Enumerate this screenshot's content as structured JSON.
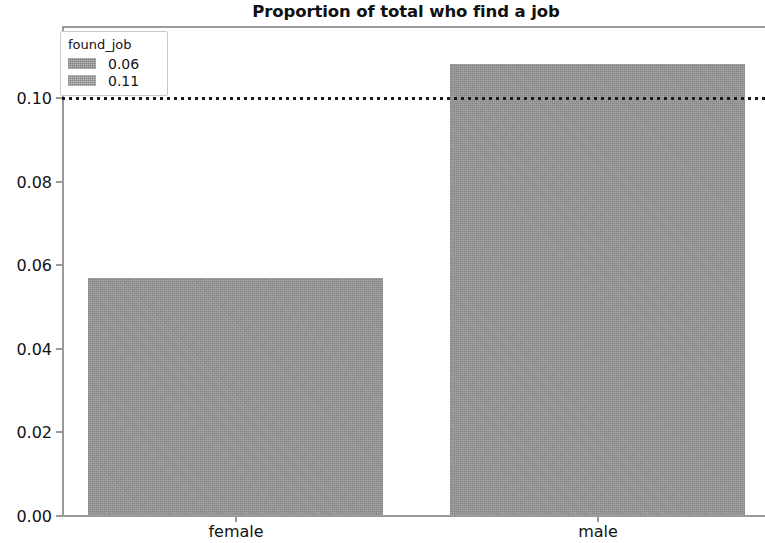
{
  "chart_data": {
    "type": "bar",
    "title": "Proportion of total who find a job",
    "xlabel": "",
    "ylabel": "",
    "categories": [
      "female",
      "male"
    ],
    "values": [
      0.057,
      0.108
    ],
    "ylim": [
      0.0,
      0.1172
    ],
    "yticks": [
      "0.00",
      "0.02",
      "0.04",
      "0.06",
      "0.08",
      "0.10"
    ],
    "ytick_values": [
      0.0,
      0.02,
      0.04,
      0.06,
      0.08,
      0.1
    ],
    "grid": false,
    "annotations": [
      {
        "type": "horizontal-reference-line",
        "value": 0.1,
        "style": "dotted",
        "color": "#1a1a1a"
      }
    ],
    "bar_color": "#9a9a9a",
    "legend": {
      "title": "found_job",
      "position": "upper left",
      "entries": [
        {
          "label": "0.06",
          "color": "#a3a3a3"
        },
        {
          "label": "0.11",
          "color": "#aaaaaa"
        }
      ]
    }
  }
}
